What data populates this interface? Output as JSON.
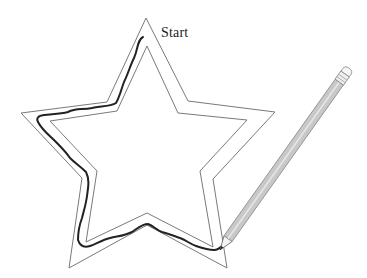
{
  "labels": {
    "start": "Start"
  },
  "colors": {
    "background": "#ffffff",
    "star_outline": "#7a7a7a",
    "traced_line": "#222222",
    "pencil_body": "#c8c8c8",
    "pencil_edge": "#8a8a8a",
    "text": "#222222"
  },
  "figure": {
    "outer_star_points": "146,18 188,101 275,112 213,179 227,268 147,225 69,268 82,178 21,113 107,102",
    "inner_star_points": "147,46 178,113 247,120 200,171 213,247 147,213 86,242 97,171 50,121 117,111",
    "traced_path": "M143,37 C137,40 138,50 134,58 C130,66 128,74 124,82 C121,90 120,96 116,103 C110,107 100,106 92,108 C82,110 76,108 68,112 C60,114 52,114 44,115 C38,116 36,118 38,122 C42,130 50,136 56,142 C62,148 66,152 70,158 C76,164 80,166 86,172 C90,180 88,188 87,196 C86,204 84,210 82,218 C79,226 78,232 78,240 C80,246 84,248 90,246 C96,244 102,240 110,238 C118,236 124,236 132,232 C138,228 142,224 148,224 C154,226 156,230 162,232 C170,234 174,236 180,238 C186,240 190,244 196,246 C202,248 208,250 214,250 C218,250 220,248 222,246"
  },
  "pencil": {
    "tip": [
      220,
      250
    ],
    "eraser": [
      348,
      70
    ]
  }
}
